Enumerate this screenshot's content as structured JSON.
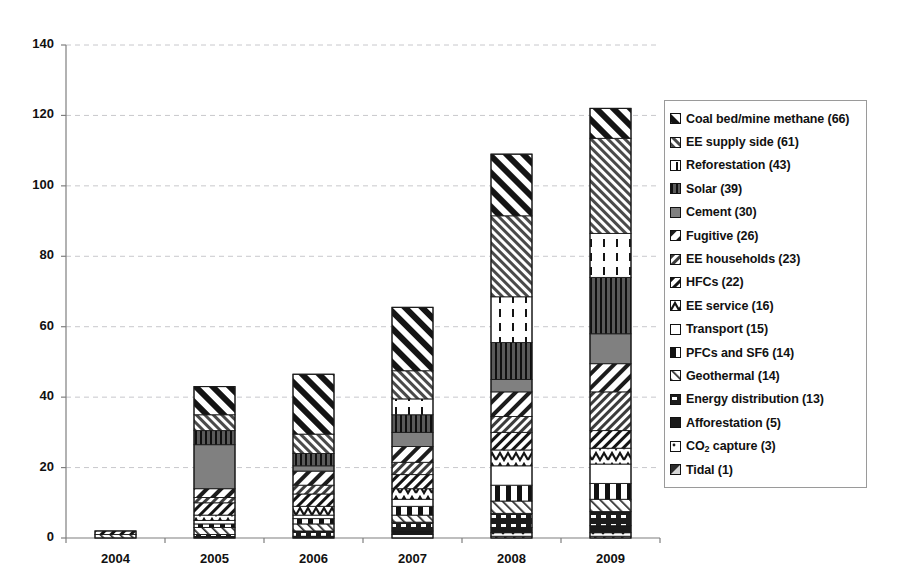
{
  "chart_data": {
    "type": "bar",
    "subtype": "stacked-bar",
    "title": "",
    "xlabel": "",
    "ylabel": "",
    "ylim": [
      0,
      140
    ],
    "ytick_values": [
      0,
      20,
      40,
      60,
      80,
      100,
      120,
      140
    ],
    "ytick_labels": [
      "0",
      "20",
      "40",
      "60",
      "80",
      "100",
      "120",
      "140"
    ],
    "grid": "horizontal-dashed",
    "legend_position": "right",
    "categories": [
      "2004",
      "2005",
      "2006",
      "2007",
      "2008",
      "2009"
    ],
    "series": [
      {
        "name": "Tidal",
        "legend_label": "Tidal (1)",
        "total": 1,
        "pattern": "tidal",
        "values": [
          0,
          0,
          0,
          0,
          0.5,
          0.5
        ]
      },
      {
        "name": "CO2 capture",
        "legend_label": "CO2 capture (3)",
        "total": 3,
        "pattern": "co2-capture",
        "values": [
          0,
          0,
          0,
          1,
          1,
          1
        ]
      },
      {
        "name": "Afforestation",
        "legend_label": "Afforestation (5)",
        "total": 5,
        "pattern": "afforestation",
        "values": [
          0,
          0,
          0.5,
          1,
          1.5,
          2
        ]
      },
      {
        "name": "Energy distribution",
        "legend_label": "Energy distribution (13)",
        "total": 13,
        "pattern": "energy-distribution",
        "values": [
          0,
          1,
          1.5,
          2.5,
          4,
          4
        ]
      },
      {
        "name": "Geothermal",
        "legend_label": "Geothermal (14)",
        "total": 14,
        "pattern": "geothermal",
        "values": [
          1,
          2,
          2,
          2,
          3.5,
          3.5
        ]
      },
      {
        "name": "PFCs and SF6",
        "legend_label": "PFCs and SF6 (14)",
        "total": 14,
        "pattern": "pfcs-sf6",
        "values": [
          0,
          1,
          1.5,
          2.5,
          4.5,
          4.5
        ]
      },
      {
        "name": "Transport",
        "legend_label": "Transport (15)",
        "total": 15,
        "pattern": "transport",
        "values": [
          0,
          1,
          1,
          2,
          5.5,
          5.5
        ]
      },
      {
        "name": "EE service",
        "legend_label": "EE service (16)",
        "total": 16,
        "pattern": "ee-service",
        "values": [
          0,
          1.5,
          2.5,
          3,
          4.5,
          4.5
        ]
      },
      {
        "name": "HFCs",
        "legend_label": "HFCs (22)",
        "total": 22,
        "pattern": "hfcs",
        "values": [
          1,
          3.5,
          3.5,
          4,
          5,
          5
        ]
      },
      {
        "name": "EE households",
        "legend_label": "EE households (23)",
        "total": 23,
        "pattern": "ee-households",
        "values": [
          0,
          1.5,
          2.5,
          3.5,
          4.5,
          11
        ]
      },
      {
        "name": "Fugitive",
        "legend_label": "Fugitive (26)",
        "total": 26,
        "pattern": "fugitive",
        "values": [
          0,
          2.5,
          4,
          4.5,
          7,
          8
        ]
      },
      {
        "name": "Cement",
        "legend_label": "Cement (30)",
        "total": 30,
        "pattern": "cement",
        "values": [
          0,
          12.5,
          1.5,
          4,
          3.5,
          8.5
        ]
      },
      {
        "name": "Solar",
        "legend_label": "Solar (39)",
        "total": 39,
        "pattern": "solar",
        "values": [
          0,
          4,
          3.5,
          5,
          10.5,
          16
        ]
      },
      {
        "name": "Reforestation",
        "legend_label": "Reforestation (43)",
        "total": 43,
        "pattern": "reforestation",
        "values": [
          0,
          0,
          0,
          4.5,
          13,
          12.5
        ]
      },
      {
        "name": "EE supply side",
        "legend_label": "EE supply side (61)",
        "total": 61,
        "pattern": "ee-supply-side",
        "values": [
          0,
          4.5,
          5.5,
          8,
          23,
          27
        ]
      },
      {
        "name": "Coal bed/mine methane",
        "legend_label": "Coal bed/mine methane (66)",
        "total": 66,
        "pattern": "coal-bed-mine-methane",
        "values": [
          0,
          8,
          17,
          18,
          17.5,
          8.5
        ]
      }
    ],
    "stack_order_bottom_to_top": [
      "Tidal",
      "CO2 capture",
      "Afforestation",
      "Energy distribution",
      "Geothermal",
      "PFCs and SF6",
      "Transport",
      "EE service",
      "HFCs",
      "EE households",
      "Fugitive",
      "Cement",
      "Solar",
      "Reforestation",
      "EE supply side",
      "Coal bed/mine methane"
    ],
    "bar_totals": [
      3,
      43,
      46.5,
      65.5,
      108,
      122
    ]
  },
  "legend": {
    "items": [
      {
        "label": "Coal bed/mine methane (66)",
        "pattern": "coal-bed-mine-methane"
      },
      {
        "label": "EE supply side (61)",
        "pattern": "ee-supply-side"
      },
      {
        "label": "Reforestation (43)",
        "pattern": "reforestation"
      },
      {
        "label": "Solar (39)",
        "pattern": "solar"
      },
      {
        "label": "Cement (30)",
        "pattern": "cement"
      },
      {
        "label": "Fugitive (26)",
        "pattern": "fugitive"
      },
      {
        "label": "EE households (23)",
        "pattern": "ee-households"
      },
      {
        "label": "HFCs (22)",
        "pattern": "hfcs"
      },
      {
        "label": "EE service (16)",
        "pattern": "ee-service"
      },
      {
        "label": "Transport (15)",
        "pattern": "transport"
      },
      {
        "label": "PFCs and SF6 (14)",
        "pattern": "pfcs-sf6"
      },
      {
        "label": "Geothermal (14)",
        "pattern": "geothermal"
      },
      {
        "label": "Energy distribution (13)",
        "pattern": "energy-distribution"
      },
      {
        "label": "Afforestation (5)",
        "pattern": "afforestation"
      },
      {
        "label": "CO2 capture (3)",
        "pattern": "co2-capture",
        "subscript": true,
        "label_pre": "CO",
        "label_sub": "2",
        "label_post": " capture (3)"
      },
      {
        "label": "Tidal (1)",
        "pattern": "tidal"
      }
    ]
  },
  "colors": {
    "axis": "#7f7f7f",
    "grid": "#c8c8cc",
    "bar_outline": "#1a1a1a",
    "text": "#111111",
    "fill_dark": "#3a3a3a",
    "fill_mid": "#808080",
    "fill_light": "#ffffff",
    "legend_border": "#9a9a9a"
  }
}
